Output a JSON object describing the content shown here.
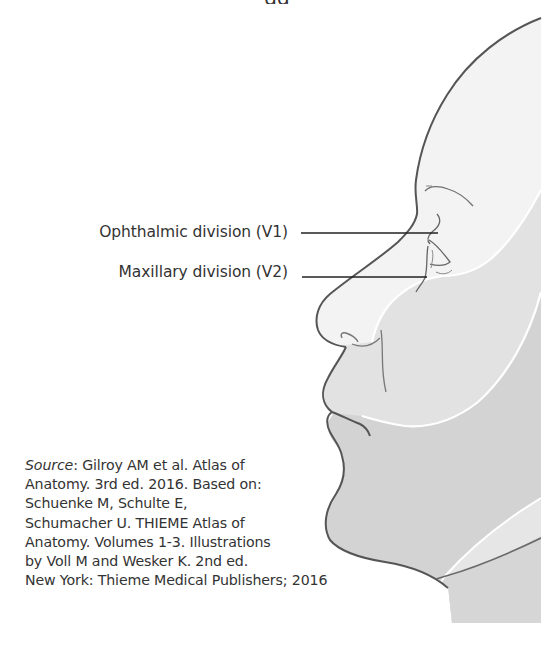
{
  "figure": {
    "top_cut_text": "gg",
    "colors": {
      "background": "#ffffff",
      "v1_region": "#f2f2f2",
      "v2_region": "#e2e2e2",
      "v3_region": "#d3d3d3",
      "outline": "#555555",
      "boundary": "#ffffff",
      "leader_line": "#222222",
      "text": "#333333"
    }
  },
  "labels": [
    {
      "id": "v1",
      "text": "Ophthalmic division (V1)"
    },
    {
      "id": "v2",
      "text": "Maxillary division (V2)"
    }
  ],
  "source": {
    "prefix": "Source",
    "lines": [
      ": Gilroy AM et al. Atlas of",
      "Anatomy. 3rd ed. 2016. Based on:",
      "Schuenke M, Schulte E,",
      "Schumacher U. THIEME Atlas of",
      "Anatomy. Volumes 1-3. Illustrations",
      "by Voll M and Wesker K. 2nd ed.",
      "New York: Thieme Medical Publishers; 2016"
    ]
  }
}
